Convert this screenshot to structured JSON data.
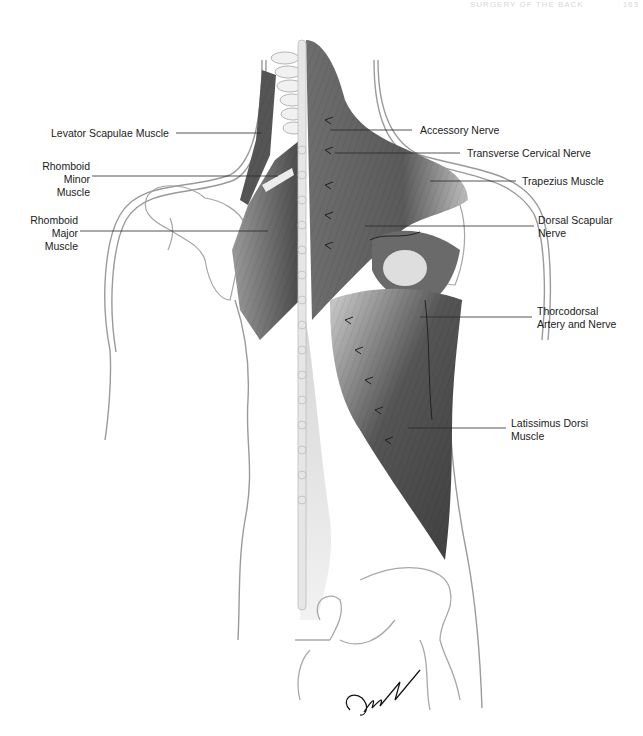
{
  "header": {
    "running_title": "SURGERY OF THE BACK",
    "page_number": "163"
  },
  "figure": {
    "accent_colors": {
      "muscle_dark": "#4a4a4a",
      "muscle_mid": "#7a7a7a",
      "outline": "#9a9a9a",
      "label_text": "#1a1a1a",
      "leader_line": "#2a2a2a"
    },
    "labels_left": [
      {
        "lines": [
          "Levator Scapulae Muscle"
        ]
      },
      {
        "lines": [
          "Rhomboid",
          "Minor",
          "Muscle"
        ]
      },
      {
        "lines": [
          "Rhomboid",
          "Major",
          "Muscle"
        ]
      }
    ],
    "labels_right": [
      {
        "lines": [
          "Accessory Nerve"
        ]
      },
      {
        "lines": [
          "Transverse Cervical Nerve"
        ]
      },
      {
        "lines": [
          "Trapezius Muscle"
        ]
      },
      {
        "lines": [
          "Dorsal Scapular",
          "Nerve"
        ]
      },
      {
        "lines": [
          "Thorcodorsal",
          "Artery and Nerve"
        ]
      },
      {
        "lines": [
          "Latissimus Dorsi",
          "Muscle"
        ]
      }
    ],
    "signature": "Galla"
  }
}
